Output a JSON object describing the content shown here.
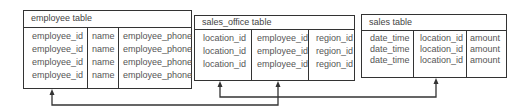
{
  "tables": {
    "employee": {
      "title": "employee table",
      "columns": [
        {
          "values": [
            "employee_id",
            "employee_id",
            "employee_id",
            "employee_id"
          ]
        },
        {
          "values": [
            "name",
            "name",
            "name",
            "name"
          ]
        },
        {
          "values": [
            "employee_phone",
            "employee_phone",
            "employee_phone",
            "employee_phone"
          ]
        }
      ]
    },
    "sales_office": {
      "title": "sales_office table",
      "columns": [
        {
          "values": [
            "location_id",
            "location_id",
            "location_id"
          ]
        },
        {
          "values": [
            "employee_id",
            "employee_id",
            "employee_id"
          ]
        },
        {
          "values": [
            "region_id",
            "region_id",
            "region_id"
          ]
        }
      ]
    },
    "sales": {
      "title": "sales table",
      "columns": [
        {
          "values": [
            "date_time",
            "date_time",
            "date_time"
          ]
        },
        {
          "values": [
            "location_id",
            "location_id",
            "location_id"
          ]
        },
        {
          "values": [
            "amount",
            "amount",
            "amount"
          ]
        }
      ]
    }
  },
  "relationships": [
    {
      "from": "sales_office.employee_id",
      "to": "employee.employee_id"
    },
    {
      "from": "sales.location_id",
      "to": "sales_office.location_id"
    }
  ],
  "colors": {
    "line": "#333333",
    "text": "#555555",
    "background": "#ffffff"
  }
}
